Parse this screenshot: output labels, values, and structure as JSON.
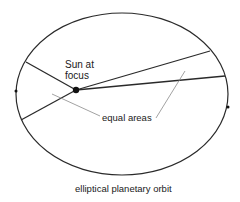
{
  "diagram": {
    "title": "elliptical planetary orbit",
    "labels": {
      "sun_line1": "Sun at",
      "sun_line2": "focus",
      "equal_areas": "equal areas"
    },
    "colors": {
      "stroke": "#2a2a2a",
      "pointer": "#8a8a8a",
      "background": "#ffffff"
    }
  }
}
